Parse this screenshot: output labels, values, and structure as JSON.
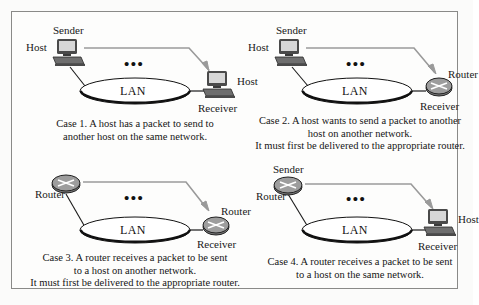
{
  "figure": {
    "colors": {
      "background": "#fbfbfa",
      "frame_border": "#8a8a88",
      "arrow": "#9a9a9a",
      "ink": "#151515",
      "lan_stroke": "#111111",
      "router_fill": "#8d8d8d",
      "host_screen": "#d7d7d7"
    },
    "dots": "•••",
    "lan_label": "LAN"
  },
  "panels": [
    {
      "id": "case-1",
      "source": {
        "type": "host-icon",
        "top_label": "Sender",
        "side_label": "Host"
      },
      "dest": {
        "type": "host-icon",
        "side_label": "Host",
        "bottom_label": "Receiver"
      },
      "lan_label": "LAN",
      "dots": "•••",
      "caption": [
        "Case 1.  A host has a packet to send to",
        "another host on the same network."
      ]
    },
    {
      "id": "case-2",
      "source": {
        "type": "host-icon",
        "top_label": "Sender",
        "side_label": "Host"
      },
      "dest": {
        "type": "router-icon",
        "side_label": "Router",
        "bottom_label": "Receiver"
      },
      "lan_label": "LAN",
      "dots": "•••",
      "caption": [
        "Case 2. A host wants to send a packet to another",
        "host on another network.",
        "It must first be delivered to the appropriate router."
      ]
    },
    {
      "id": "case-3",
      "source": {
        "type": "router-icon",
        "top_label": "",
        "side_label": "Router"
      },
      "dest": {
        "type": "router-icon",
        "side_label": "Router",
        "bottom_label": "Receiver"
      },
      "lan_label": "LAN",
      "dots": "•••",
      "caption": [
        "Case 3. A router receives a packet  to be sent",
        "to a host on another network.",
        "It must first be delivered to the appropriate  router."
      ]
    },
    {
      "id": "case-4",
      "source": {
        "type": "router-icon",
        "top_label": "Sender",
        "side_label": "Router"
      },
      "dest": {
        "type": "host-icon",
        "side_label": "Host",
        "bottom_label": "Receiver"
      },
      "lan_label": "LAN",
      "dots": "•••",
      "caption": [
        "Case 4.  A router receives a packet  to be sent",
        "to a host on the same network."
      ]
    }
  ]
}
